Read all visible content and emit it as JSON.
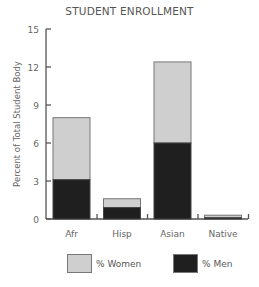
{
  "chart_data": {
    "type": "bar",
    "stacked": true,
    "title": "STUDENT ENROLLMENT",
    "xlabel": "",
    "ylabel": "Percent of Total Student Body",
    "ylim": [
      0,
      15
    ],
    "yticks": [
      0,
      3,
      6,
      9,
      12,
      15
    ],
    "grid": false,
    "legend_position": "bottom",
    "categories": [
      "Afr",
      "Hisp",
      "Asian",
      "Native"
    ],
    "series": [
      {
        "name": "% Men",
        "color": "#1f1f1f",
        "values": [
          3.1,
          0.9,
          6.0,
          0.1
        ]
      },
      {
        "name": "% Women",
        "color": "#cfcfcf",
        "values": [
          4.9,
          0.7,
          6.4,
          0.2
        ]
      }
    ],
    "totals": [
      8.0,
      1.6,
      12.4,
      0.3
    ]
  },
  "legend": {
    "women_label": "% Women",
    "men_label": "% Men"
  }
}
